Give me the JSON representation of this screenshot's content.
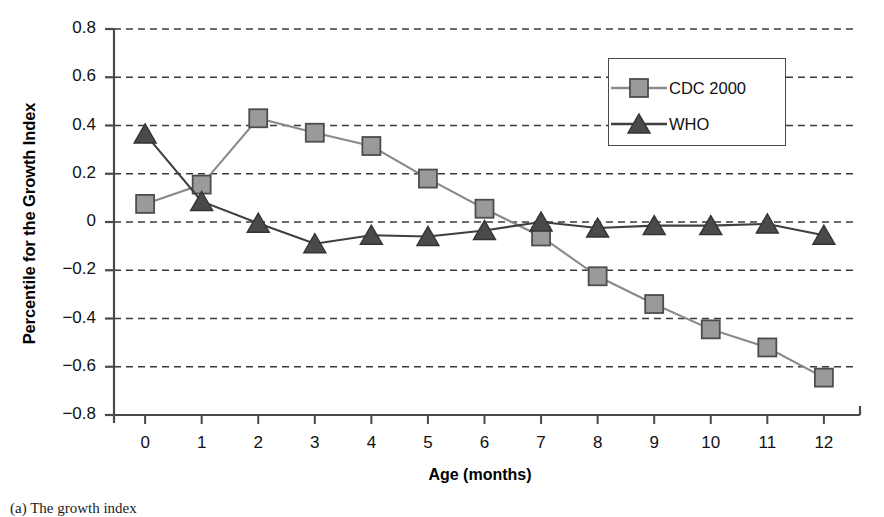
{
  "chart_data": {
    "type": "line",
    "title": "",
    "xlabel": "Age (months)",
    "ylabel": "Percentile for the Growth Index",
    "x": [
      0,
      1,
      2,
      3,
      4,
      5,
      6,
      7,
      8,
      9,
      10,
      11,
      12
    ],
    "xlim": [
      -0.55,
      12.55
    ],
    "ylim": [
      -0.8,
      0.8
    ],
    "xticks": [
      "0",
      "1",
      "2",
      "3",
      "4",
      "5",
      "6",
      "7",
      "8",
      "9",
      "10",
      "11",
      "12"
    ],
    "yticks": [
      "0.8",
      "0.6",
      "0.4",
      "0.2",
      "0",
      "-0.2",
      "-0.4",
      "-0.6",
      "-0.8"
    ],
    "ytick_values": [
      0.8,
      0.6,
      0.4,
      0.2,
      0,
      -0.2,
      -0.4,
      -0.6,
      -0.8
    ],
    "grid": "horizontal-dashed",
    "legend_position": "top-right",
    "series": [
      {
        "name": "CDC 2000",
        "marker": "square",
        "marker_color": "#9a9a9a",
        "marker_edge_color": "#4d4d4d",
        "line_color": "#8a8a8a",
        "values": [
          0.075,
          0.155,
          0.43,
          0.37,
          0.315,
          0.18,
          0.055,
          -0.06,
          -0.225,
          -0.34,
          -0.445,
          -0.52,
          -0.645
        ]
      },
      {
        "name": "WHO",
        "marker": "triangle",
        "marker_color": "#4a4a4a",
        "marker_edge_color": "#333333",
        "line_color": "#3f3f3f",
        "values": [
          0.365,
          0.085,
          -0.005,
          -0.09,
          -0.055,
          -0.06,
          -0.035,
          0.0,
          -0.025,
          -0.015,
          -0.015,
          -0.008,
          -0.055
        ]
      }
    ]
  },
  "legend": {
    "entries": [
      {
        "label": "CDC 2000"
      },
      {
        "label": "WHO"
      }
    ]
  },
  "axes": {
    "x_title": "Age (months)",
    "y_title": "Percentile for the Growth Index"
  },
  "caption": {
    "text": "(a) The growth index"
  },
  "colors": {
    "axis": "#4a4a4a",
    "grid": "#3a3a3a",
    "cdc_line": "#8a8a8a",
    "cdc_marker": "#9a9a9a",
    "who_line": "#3f3f3f",
    "who_marker": "#4a4a4a",
    "text": "#111111",
    "background": "#ffffff"
  }
}
